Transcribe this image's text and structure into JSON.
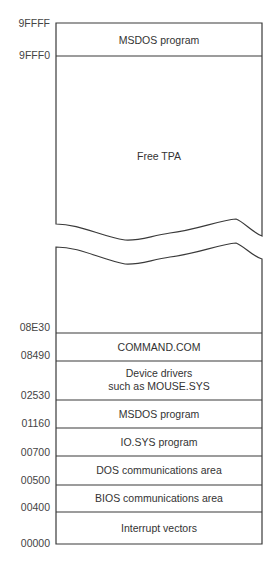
{
  "diagram": {
    "type": "memory-map",
    "colors": {
      "line": "#3a3a3a",
      "text": "#333333",
      "background": "#ffffff"
    },
    "segments": [
      {
        "label": "MSDOS program",
        "start": "9FFF0",
        "end": "9FFFF"
      },
      {
        "label": "Free TPA",
        "start": "08E30",
        "end": "9FFF0",
        "broken": true
      },
      {
        "label": "COMMAND.COM",
        "start": "08490",
        "end": "08E30"
      },
      {
        "label": "Device drivers such as MOUSE.SYS",
        "line1": "Device drivers",
        "line2": "such as MOUSE.SYS",
        "start": "02530",
        "end": "08490"
      },
      {
        "label": "MSDOS program",
        "start": "01160",
        "end": "02530"
      },
      {
        "label": "IO.SYS program",
        "start": "00700",
        "end": "01160"
      },
      {
        "label": "DOS communications area",
        "start": "00500",
        "end": "00700"
      },
      {
        "label": "BIOS communications area",
        "start": "00400",
        "end": "00500"
      },
      {
        "label": "Interrupt vectors",
        "start": "00000",
        "end": "00400"
      }
    ],
    "addresses": [
      "9FFFF",
      "9FFF0",
      "08E30",
      "08490",
      "02530",
      "01160",
      "00700",
      "00500",
      "00400",
      "00000"
    ]
  }
}
